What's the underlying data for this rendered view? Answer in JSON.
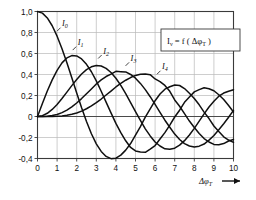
{
  "chart_data": {
    "type": "line",
    "title": "",
    "subtitle": "",
    "xlabel": "Δφ_T",
    "xlabel_display": "Δφ",
    "xlabel_sub": "T",
    "ylabel": "I_ν",
    "xlim": [
      0,
      10
    ],
    "ylim": [
      -0.4,
      1.0
    ],
    "grid": true,
    "legend_position": "inside-top-right",
    "legend_text": "I_ν = f( Δφ_T )",
    "legend_parts": {
      "sym": "I",
      "sym_sub": "ν",
      "eq": "= f (",
      "arg": "Δφ",
      "arg_sub": "T",
      "close": ")"
    },
    "x_ticks": [
      "0",
      "1",
      "2",
      "3",
      "4",
      "5",
      "6",
      "7",
      "8",
      "9",
      "10"
    ],
    "x_tick_values": [
      0,
      1,
      2,
      3,
      4,
      5,
      6,
      7,
      8,
      9,
      10
    ],
    "y_ticks": [
      "1,0",
      "0,8",
      "0,6",
      "0,4",
      "0,2",
      "0",
      "-0,2",
      "-0,4"
    ],
    "y_tick_values": [
      1.0,
      0.8,
      0.6,
      0.4,
      0.2,
      0,
      -0.2,
      -0.4
    ],
    "axis_arrow": "→",
    "line_color": "#101010",
    "grid_color": "#b9b9b9",
    "frame_color": "#3a3a3a",
    "zero_line_color": "#4a4a4a",
    "annotations": [
      {
        "label": "I_0",
        "sym": "I",
        "sub": "0",
        "x": 1.25,
        "y": 0.86
      },
      {
        "label": "I_1",
        "sym": "I",
        "sub": "1",
        "x": 2.05,
        "y": 0.68
      },
      {
        "label": "I_2",
        "sym": "I",
        "sub": "2",
        "x": 3.35,
        "y": 0.6
      },
      {
        "label": "I_3",
        "sym": "I",
        "sub": "3",
        "x": 4.75,
        "y": 0.53
      },
      {
        "label": "I_4",
        "sym": "I",
        "sub": "4",
        "x": 6.35,
        "y": 0.45
      }
    ],
    "series": [
      {
        "name": "I_0",
        "order": 0,
        "x": [
          0,
          0.25,
          0.5,
          0.75,
          1,
          1.25,
          1.5,
          1.75,
          2,
          2.25,
          2.5,
          2.75,
          3,
          3.25,
          3.5,
          3.75,
          4,
          4.25,
          4.5,
          4.75,
          5,
          5.25,
          5.5,
          5.75,
          6,
          6.25,
          6.5,
          6.75,
          7,
          7.25,
          7.5,
          7.75,
          8,
          8.25,
          8.5,
          8.75,
          9,
          9.25,
          9.5,
          9.75,
          10
        ],
        "values": [
          1.0,
          0.9844,
          0.9385,
          0.8642,
          0.7652,
          0.6459,
          0.5118,
          0.369,
          0.2239,
          0.0827,
          -0.0484,
          -0.1641,
          -0.2601,
          -0.3326,
          -0.3801,
          -0.4018,
          -0.3971,
          -0.3679,
          -0.3205,
          -0.2578,
          -0.1776,
          -0.0968,
          -0.0068,
          0.0717,
          0.1506,
          0.2136,
          0.2601,
          0.2837,
          0.3001,
          0.2951,
          0.2663,
          0.2218,
          0.1717,
          0.1112,
          0.0419,
          -0.0196,
          -0.0903,
          -0.1435,
          -0.1939,
          -0.2243,
          -0.2459
        ]
      },
      {
        "name": "I_1",
        "order": 1,
        "x": [
          0,
          0.25,
          0.5,
          0.75,
          1,
          1.25,
          1.5,
          1.75,
          2,
          2.25,
          2.5,
          2.75,
          3,
          3.25,
          3.5,
          3.75,
          4,
          4.25,
          4.5,
          4.75,
          5,
          5.25,
          5.5,
          5.75,
          6,
          6.25,
          6.5,
          6.75,
          7,
          7.25,
          7.5,
          7.75,
          8,
          8.25,
          8.5,
          8.75,
          9,
          9.25,
          9.5,
          9.75,
          10
        ],
        "values": [
          0,
          0.124,
          0.2423,
          0.3492,
          0.4401,
          0.5106,
          0.5579,
          0.5802,
          0.5767,
          0.5483,
          0.4971,
          0.426,
          0.3391,
          0.2404,
          0.1374,
          0.0341,
          -0.066,
          -0.1538,
          -0.2311,
          -0.2951,
          -0.3276,
          -0.3371,
          -0.3414,
          -0.311,
          -0.2767,
          -0.215,
          -0.1538,
          -0.0819,
          -0.0047,
          0.0599,
          0.1352,
          0.1864,
          0.2346,
          0.2559,
          0.2731,
          0.2644,
          0.2453,
          0.2069,
          0.1613,
          0.1043,
          0.0435
        ]
      },
      {
        "name": "I_2",
        "order": 2,
        "x": [
          0,
          0.25,
          0.5,
          0.75,
          1,
          1.25,
          1.5,
          1.75,
          2,
          2.25,
          2.5,
          2.75,
          3,
          3.25,
          3.5,
          3.75,
          4,
          4.25,
          4.5,
          4.75,
          5,
          5.25,
          5.5,
          5.75,
          6,
          6.25,
          6.5,
          6.75,
          7,
          7.25,
          7.5,
          7.75,
          8,
          8.25,
          8.5,
          8.75,
          9,
          9.25,
          9.5,
          9.75,
          10
        ],
        "values": [
          0,
          0.0078,
          0.0306,
          0.0671,
          0.1149,
          0.1711,
          0.2321,
          0.294,
          0.3528,
          0.405,
          0.4461,
          0.4732,
          0.4861,
          0.4813,
          0.4586,
          0.4194,
          0.3641,
          0.2962,
          0.2178,
          0.1331,
          0.0466,
          -0.0374,
          -0.1173,
          -0.185,
          -0.2429,
          -0.2811,
          -0.3074,
          -0.3115,
          -0.3014,
          -0.2726,
          -0.2303,
          -0.1757,
          -0.113,
          -0.0443,
          0.0248,
          0.0908,
          0.1448,
          0.193,
          0.2235,
          0.2408,
          0.2546
        ]
      },
      {
        "name": "I_3",
        "order": 3,
        "x": [
          0,
          0.25,
          0.5,
          0.75,
          1,
          1.25,
          1.5,
          1.75,
          2,
          2.25,
          2.5,
          2.75,
          3,
          3.25,
          3.5,
          3.75,
          4,
          4.25,
          4.5,
          4.75,
          5,
          5.25,
          5.5,
          5.75,
          6,
          6.25,
          6.5,
          6.75,
          7,
          7.25,
          7.5,
          7.75,
          8,
          8.25,
          8.5,
          8.75,
          9,
          9.25,
          9.5,
          9.75,
          10
        ],
        "values": [
          0,
          0.0003,
          0.0026,
          0.0086,
          0.0196,
          0.0369,
          0.061,
          0.092,
          0.1289,
          0.1707,
          0.2166,
          0.2626,
          0.3091,
          0.3487,
          0.3809,
          0.4035,
          0.4302,
          0.4273,
          0.4244,
          0.4004,
          0.3648,
          0.3152,
          0.2561,
          0.1884,
          0.1148,
          0.0398,
          -0.0353,
          -0.1026,
          -0.1676,
          -0.2188,
          -0.2581,
          -0.2811,
          -0.2911,
          -0.2825,
          -0.2623,
          -0.2253,
          -0.1809,
          -0.1258,
          -0.0685,
          -0.0071,
          0.0584
        ]
      },
      {
        "name": "I_4",
        "order": 4,
        "x": [
          0,
          0.25,
          0.5,
          0.75,
          1,
          1.25,
          1.5,
          1.75,
          2,
          2.25,
          2.5,
          2.75,
          3,
          3.25,
          3.5,
          3.75,
          4,
          4.25,
          4.5,
          4.75,
          5,
          5.25,
          5.5,
          5.75,
          6,
          6.25,
          6.5,
          6.75,
          7,
          7.25,
          7.5,
          7.75,
          8,
          8.25,
          8.5,
          8.75,
          9,
          9.25,
          9.5,
          9.75,
          10
        ],
        "values": [
          0,
          1e-05,
          0.0002,
          0.0008,
          0.0025,
          0.0059,
          0.0118,
          0.0209,
          0.034,
          0.0513,
          0.0738,
          0.1008,
          0.132,
          0.1663,
          0.2044,
          0.2423,
          0.2811,
          0.3151,
          0.3453,
          0.371,
          0.3912,
          0.4025,
          0.4057,
          0.3987,
          0.3576,
          0.3325,
          0.296,
          0.24,
          0.1578,
          0.0975,
          0.0272,
          -0.0433,
          -0.1054,
          -0.162,
          -0.2102,
          -0.243,
          -0.2655,
          -0.2684,
          -0.2577,
          -0.2331,
          -0.2196
        ]
      }
    ]
  }
}
